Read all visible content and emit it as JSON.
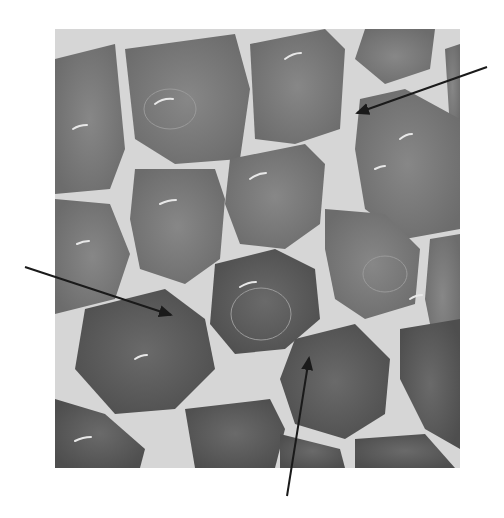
{
  "figure": {
    "type": "grayscale micrograph",
    "colors": {
      "background": "#ffffff",
      "cell": "#7e7e7e",
      "cell_dark": "#5f5f5f",
      "boundary": "#d9d9d9",
      "arrow": "#1a1a1a"
    },
    "image_box": {
      "x": 55,
      "y": 29,
      "width": 405,
      "height": 439
    },
    "arrows": [
      {
        "from": [
          487,
          67
        ],
        "to": [
          355,
          114
        ]
      },
      {
        "from": [
          25,
          267
        ],
        "to": [
          173,
          316
        ]
      },
      {
        "from": [
          287,
          496
        ],
        "to": [
          310,
          356
        ]
      }
    ]
  }
}
